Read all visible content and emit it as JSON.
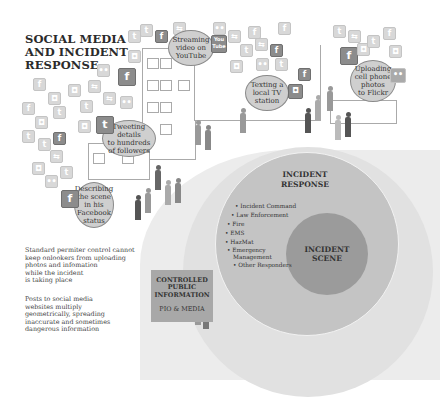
{
  "title": {
    "line1": "SOCIAL MEDIA",
    "line2": "AND INCIDENT",
    "line3": "RESPONSE"
  },
  "bubbles": {
    "youtube": {
      "l1": "Streaming",
      "l2": "video on",
      "l3": "YouTube",
      "icon": "You Tube"
    },
    "tv": {
      "l1": "Texting a",
      "l2": "local TV",
      "l3": "station"
    },
    "flickr": {
      "l1": "Uploading",
      "l2": "cell phone",
      "l3": "photos",
      "l4": "to Flickr"
    },
    "twitter": {
      "l1": "Tweeting",
      "l2": "details",
      "l3": "to hundreds",
      "l4": "of followers"
    },
    "facebook": {
      "l1": "Describing",
      "l2": "the scene",
      "l3": "in his",
      "l4": "Facebook",
      "l5": "status"
    }
  },
  "notes": {
    "perimeter": [
      "Standard permiter control cannot",
      "keep onlookers from uploading",
      "photos and infomation",
      "while the incident",
      "is taking place"
    ],
    "posts": [
      "Posts to social media",
      "websites multiply",
      "geometrically, spreading",
      "inaccurate and sometimes",
      "dangerous information"
    ]
  },
  "controlled": {
    "l1": "CONTROLLED",
    "l2": "PUBLIC",
    "l3": "INFORMATION",
    "pio": "PIO & MEDIA"
  },
  "incident_response": {
    "l1": "INCIDENT",
    "l2": "RESPONSE",
    "items": [
      "Incident Command",
      "Law Enforcement",
      "Fire",
      "EMS",
      "HazMat",
      "Emergency",
      "Management",
      "Other Responders"
    ]
  },
  "incident_scene": {
    "l1": "INCIDENT",
    "l2": "SCENE"
  },
  "icons": {
    "facebook": "f",
    "twitter": "t",
    "flickr": "••",
    "chat": "◘",
    "share": "⇆"
  }
}
